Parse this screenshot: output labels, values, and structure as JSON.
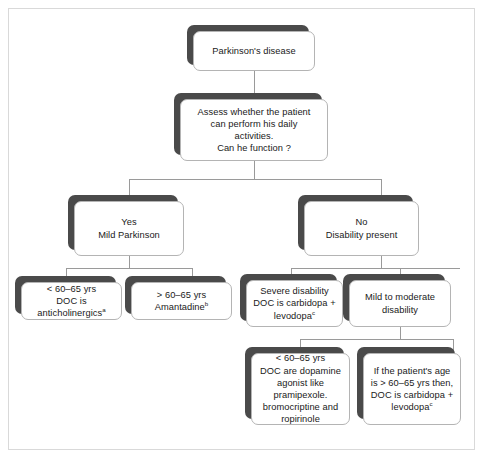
{
  "diagram": {
    "colors": {
      "shadow": "#4a4a4a",
      "box_border": "#b4b4b4",
      "box_fill": "#ffffff",
      "connector": "#9a9a9a",
      "page_border": "#d9d9d9",
      "text": "#1a1a1a"
    },
    "nodes": {
      "root": "Parkinson's disease",
      "assess": "Assess whether the patient\ncan perform his daily\nactivities.\nCan he function ?",
      "yes_branch": "Yes\nMild Parkinson",
      "no_branch": "No\nDisability present",
      "anticholinergics": {
        "line1": "< 60–65 yrs",
        "line2": "DOC is anticholinergics",
        "footnote": "a"
      },
      "amantadine": {
        "line1": "> 60–65 yrs",
        "line2": "Amantadine",
        "footnote": "b"
      },
      "severe": {
        "line1": "Severe disability",
        "line2": "DOC is carbidopa +",
        "line3": "levodopa",
        "footnote": "c"
      },
      "mild_moderate": "Mild to moderate\ndisability",
      "dopamine_agonist": "< 60–65 yrs\nDOC are dopamine\nagonist like pramipexole.\nbromocriptine and\nropirinole",
      "older_carbidopa": {
        "line1": "If the patient's age",
        "line2": "is > 60–65 yrs then,",
        "line3": "DOC is carbidopa +",
        "line4": "levodopa",
        "footnote": "c"
      }
    }
  }
}
